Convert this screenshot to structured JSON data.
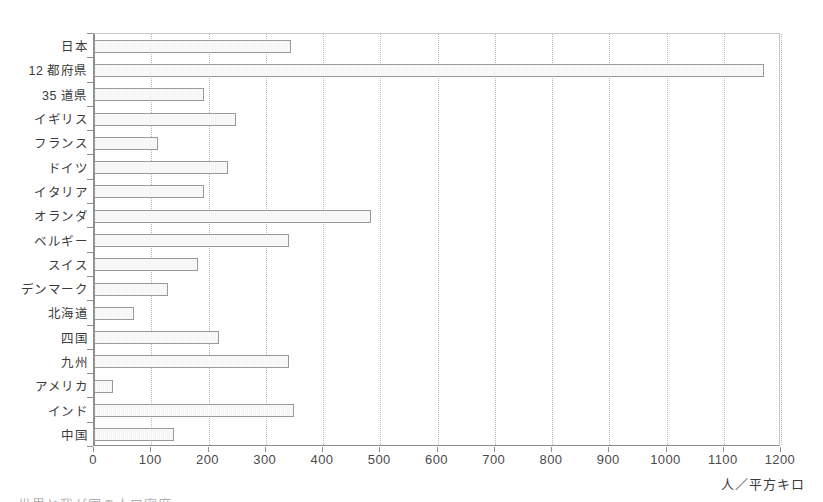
{
  "chart_data": {
    "type": "bar",
    "orientation": "horizontal",
    "title": "",
    "xlabel": "人／平方キロ",
    "ylabel": "",
    "xlim": [
      0,
      1200
    ],
    "grid": true,
    "legend": false,
    "xticks": [
      0,
      100,
      200,
      300,
      400,
      500,
      600,
      700,
      800,
      900,
      1000,
      1100,
      1200
    ],
    "xticklabels": [
      "0",
      "100",
      "200",
      "300",
      "400",
      "500",
      "600",
      "700",
      "800",
      "900",
      "1000",
      "1100",
      "1200"
    ],
    "categories": [
      "日本",
      "12 都府県",
      "35 道県",
      "イギリス",
      "フランス",
      "ドイツ",
      "イタリア",
      "オランダ",
      "ベルギー",
      "スイス",
      "デンマーク",
      "北海道",
      "四国",
      "九州",
      "アメリカ",
      "インド",
      "中国"
    ],
    "values": [
      344,
      1170,
      192,
      248,
      112,
      234,
      192,
      484,
      340,
      182,
      129,
      70,
      218,
      340,
      33,
      350,
      140
    ]
  },
  "axis": {
    "unit_label": "人／平方キロ"
  },
  "caption": {
    "bottom_text": "世界と我が国の人口密度"
  }
}
